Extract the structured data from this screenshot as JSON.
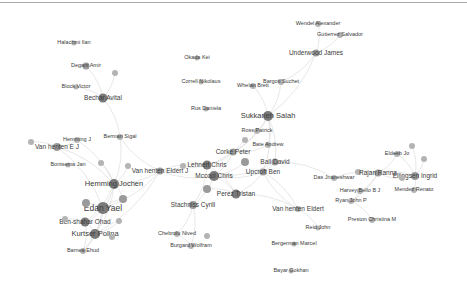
{
  "graph": {
    "type": "network",
    "node_color": "#8c8c8c",
    "edge_color": "#dcdcdc",
    "nodes": [
      {
        "id": "n1",
        "label": "Wendel Alexander",
        "x": 318,
        "y": 24,
        "r": 3,
        "size": "s1"
      },
      {
        "id": "n2",
        "label": "Gutierrez Salvador",
        "x": 340,
        "y": 35,
        "r": 3,
        "size": "s1"
      },
      {
        "id": "n3",
        "label": "Underwood James",
        "x": 316,
        "y": 53,
        "r": 3.5,
        "size": "s2"
      },
      {
        "id": "n4",
        "label": "Halachmi Ilan",
        "x": 74,
        "y": 43,
        "r": 2.5,
        "size": "s1"
      },
      {
        "id": "n5",
        "label": "Degani Amir",
        "x": 86,
        "y": 66,
        "r": 3.5,
        "size": "s1"
      },
      {
        "id": "n6",
        "label": "Block Victor",
        "x": 76,
        "y": 87,
        "r": 2.5,
        "size": "s1"
      },
      {
        "id": "n7",
        "label": "Bechar Avital",
        "x": 103,
        "y": 98,
        "r": 4.5,
        "size": "s2"
      },
      {
        "id": "n7b",
        "label": "",
        "x": 115,
        "y": 73,
        "r": 3,
        "size": "s1"
      },
      {
        "id": "n8",
        "label": "Okada Kei",
        "x": 197,
        "y": 58,
        "r": 2.5,
        "size": "s1"
      },
      {
        "id": "n9",
        "label": "Correll Nikolaus",
        "x": 201,
        "y": 82,
        "r": 2.5,
        "size": "s1"
      },
      {
        "id": "n10",
        "label": "Whelan Brett",
        "x": 253,
        "y": 86,
        "r": 3,
        "size": "s1"
      },
      {
        "id": "n11",
        "label": "Bargoti Suchet",
        "x": 281,
        "y": 82,
        "r": 3,
        "size": "s1"
      },
      {
        "id": "n12",
        "label": "Rus Daniela",
        "x": 206,
        "y": 109,
        "r": 2.5,
        "size": "s1"
      },
      {
        "id": "n13",
        "label": "Sukkarieh Salah",
        "x": 268,
        "y": 116,
        "r": 5,
        "size": "s3"
      },
      {
        "id": "n14",
        "label": "Ross Patrick",
        "x": 257,
        "y": 131,
        "r": 3,
        "size": "s1"
      },
      {
        "id": "n15",
        "label": "Bate Andrew",
        "x": 268,
        "y": 145,
        "r": 3,
        "size": "s1"
      },
      {
        "id": "n15b",
        "label": "",
        "x": 245,
        "y": 140,
        "r": 3,
        "size": "s1"
      },
      {
        "id": "n16",
        "label": "Corke Peter",
        "x": 233,
        "y": 152,
        "r": 3.5,
        "size": "s2"
      },
      {
        "id": "n16b",
        "label": "",
        "x": 245,
        "y": 162,
        "r": 4,
        "size": "s1"
      },
      {
        "id": "n17",
        "label": "Ball David",
        "x": 275,
        "y": 162,
        "r": 3.5,
        "size": "s2"
      },
      {
        "id": "n18",
        "label": "Upcroft Ben",
        "x": 263,
        "y": 172,
        "r": 3.5,
        "size": "s2"
      },
      {
        "id": "n19",
        "label": "Lehnert Chris",
        "x": 207,
        "y": 165,
        "r": 4.5,
        "size": "s2"
      },
      {
        "id": "n20",
        "label": "Mccool Chris",
        "x": 214,
        "y": 176,
        "r": 5,
        "size": "s2"
      },
      {
        "id": "n20b",
        "label": "",
        "x": 207,
        "y": 189,
        "r": 4,
        "size": "s1"
      },
      {
        "id": "n21",
        "label": "Perez Tristan",
        "x": 236,
        "y": 194,
        "r": 4.5,
        "size": "s2"
      },
      {
        "id": "n22",
        "label": "Stachniss Cyrill",
        "x": 193,
        "y": 205,
        "r": 4,
        "size": "s2"
      },
      {
        "id": "n23",
        "label": "Van henten Eldert J",
        "x": 160,
        "y": 171,
        "r": 3.5,
        "size": "s2"
      },
      {
        "id": "n23b",
        "label": "",
        "x": 183,
        "y": 166,
        "r": 3,
        "size": "s1"
      },
      {
        "id": "n24",
        "label": "Berman Sigal",
        "x": 120,
        "y": 137,
        "r": 3,
        "size": "s1"
      },
      {
        "id": "n25",
        "label": "Hemming J",
        "x": 77,
        "y": 140,
        "r": 3,
        "size": "s1"
      },
      {
        "id": "n26",
        "label": "Van henten E J",
        "x": 57,
        "y": 147,
        "r": 4,
        "size": "s2"
      },
      {
        "id": "n26b",
        "label": "",
        "x": 31,
        "y": 142,
        "r": 3,
        "size": "s1"
      },
      {
        "id": "n27",
        "label": "Bontsema Jan",
        "x": 68,
        "y": 165,
        "r": 2.5,
        "size": "s1"
      },
      {
        "id": "n27b",
        "label": "",
        "x": 101,
        "y": 163,
        "r": 3,
        "size": "s1"
      },
      {
        "id": "n27c",
        "label": "",
        "x": 128,
        "y": 166,
        "r": 3,
        "size": "s1"
      },
      {
        "id": "n28",
        "label": "Hemming Jochen",
        "x": 114,
        "y": 184,
        "r": 5,
        "size": "s3"
      },
      {
        "id": "n28b",
        "label": "",
        "x": 123,
        "y": 199,
        "r": 4,
        "size": "s1"
      },
      {
        "id": "n29",
        "label": "Edan Yael",
        "x": 103,
        "y": 208,
        "r": 6,
        "size": "s4"
      },
      {
        "id": "n29b",
        "label": "",
        "x": 86,
        "y": 203,
        "r": 4,
        "size": "s1"
      },
      {
        "id": "n30",
        "label": "Ben-shahar Ohad",
        "x": 85,
        "y": 222,
        "r": 4.5,
        "size": "s2"
      },
      {
        "id": "n30b",
        "label": "",
        "x": 65,
        "y": 219,
        "r": 3,
        "size": "s1"
      },
      {
        "id": "n30c",
        "label": "",
        "x": 119,
        "y": 221,
        "r": 3,
        "size": "s1"
      },
      {
        "id": "n31",
        "label": "Kurtser Polina",
        "x": 95,
        "y": 234,
        "r": 5,
        "size": "s3"
      },
      {
        "id": "n31b",
        "label": "",
        "x": 112,
        "y": 237,
        "r": 3,
        "size": "s1"
      },
      {
        "id": "n32",
        "label": "Barnea Ehud",
        "x": 83,
        "y": 251,
        "r": 3,
        "size": "s1"
      },
      {
        "id": "n33",
        "label": "Chebrolu Nived",
        "x": 177,
        "y": 234,
        "r": 3,
        "size": "s1"
      },
      {
        "id": "n33b",
        "label": "",
        "x": 207,
        "y": 236,
        "r": 3,
        "size": "s1"
      },
      {
        "id": "n34",
        "label": "Burgard Wolfram",
        "x": 191,
        "y": 246,
        "r": 3,
        "size": "s1"
      },
      {
        "id": "n35",
        "label": "Das Jnaneshwar",
        "x": 334,
        "y": 178,
        "r": 3,
        "size": "s1"
      },
      {
        "id": "n35b",
        "label": "",
        "x": 358,
        "y": 172,
        "r": 3,
        "size": "s1"
      },
      {
        "id": "n36",
        "label": "Van henten Eldert",
        "x": 298,
        "y": 209,
        "r": 3,
        "size": "s2"
      },
      {
        "id": "n37",
        "label": "Reid John",
        "x": 318,
        "y": 228,
        "r": 2.5,
        "size": "s1"
      },
      {
        "id": "n38",
        "label": "Bergerman Marcel",
        "x": 294,
        "y": 244,
        "r": 2.5,
        "size": "s1"
      },
      {
        "id": "n39",
        "label": "Bayar Gokhan",
        "x": 291,
        "y": 271,
        "r": 2.5,
        "size": "s1"
      },
      {
        "id": "n40",
        "label": "Eldeeb Jo",
        "x": 397,
        "y": 154,
        "r": 3,
        "size": "s1"
      },
      {
        "id": "n40b",
        "label": "",
        "x": 412,
        "y": 146,
        "r": 3,
        "size": "s1"
      },
      {
        "id": "n40c",
        "label": "",
        "x": 424,
        "y": 159,
        "r": 3,
        "size": "s1"
      },
      {
        "id": "n41",
        "label": "Rajan Ranna",
        "x": 378,
        "y": 173,
        "r": 3.5,
        "size": "s2"
      },
      {
        "id": "n42",
        "label": "Ellingsen Ingrid",
        "x": 415,
        "y": 176,
        "r": 4,
        "size": "s2"
      },
      {
        "id": "n42b",
        "label": "",
        "x": 402,
        "y": 178,
        "r": 3,
        "size": "s1"
      },
      {
        "id": "n43",
        "label": "Harvey Bello B J",
        "x": 360,
        "y": 191,
        "r": 3,
        "size": "s1"
      },
      {
        "id": "n44",
        "label": "Mendez Renato",
        "x": 414,
        "y": 190,
        "r": 3,
        "size": "s1"
      },
      {
        "id": "n45",
        "label": "Ryan John P",
        "x": 351,
        "y": 201,
        "r": 3,
        "size": "s1"
      },
      {
        "id": "n46",
        "label": "Preston Christina M",
        "x": 372,
        "y": 220,
        "r": 3,
        "size": "s1"
      }
    ],
    "edges": [
      [
        "n1",
        "n3"
      ],
      [
        "n2",
        "n3"
      ],
      [
        "n3",
        "n11"
      ],
      [
        "n3",
        "n13"
      ],
      [
        "n10",
        "n13"
      ],
      [
        "n11",
        "n13"
      ],
      [
        "n13",
        "n14"
      ],
      [
        "n13",
        "n15"
      ],
      [
        "n13",
        "n16"
      ],
      [
        "n13",
        "n18"
      ],
      [
        "n13",
        "n17"
      ],
      [
        "n14",
        "n16"
      ],
      [
        "n15",
        "n16"
      ],
      [
        "n15b",
        "n19"
      ],
      [
        "n16",
        "n19"
      ],
      [
        "n16",
        "n20"
      ],
      [
        "n16b",
        "n20"
      ],
      [
        "n17",
        "n18"
      ],
      [
        "n18",
        "n20"
      ],
      [
        "n17",
        "n20"
      ],
      [
        "n18",
        "n21"
      ],
      [
        "n19",
        "n20"
      ],
      [
        "n19",
        "n21"
      ],
      [
        "n20",
        "n21"
      ],
      [
        "n20",
        "n22"
      ],
      [
        "n20b",
        "n21"
      ],
      [
        "n19",
        "n22"
      ],
      [
        "n22",
        "n33"
      ],
      [
        "n22",
        "n34"
      ],
      [
        "n33",
        "n34"
      ],
      [
        "n19",
        "n23b"
      ],
      [
        "n23b",
        "n23"
      ],
      [
        "n23",
        "n28"
      ],
      [
        "n23",
        "n24"
      ],
      [
        "n23",
        "n19"
      ],
      [
        "n20",
        "n23"
      ],
      [
        "n5",
        "n7"
      ],
      [
        "n6",
        "n7"
      ],
      [
        "n7b",
        "n7"
      ],
      [
        "n7",
        "n24"
      ],
      [
        "n24",
        "n28"
      ],
      [
        "n25",
        "n28"
      ],
      [
        "n26",
        "n28"
      ],
      [
        "n26b",
        "n26"
      ],
      [
        "n25",
        "n26"
      ],
      [
        "n27b",
        "n28"
      ],
      [
        "n27c",
        "n28"
      ],
      [
        "n28",
        "n29"
      ],
      [
        "n28",
        "n28b"
      ],
      [
        "n28",
        "n31"
      ],
      [
        "n29",
        "n30"
      ],
      [
        "n29",
        "n31"
      ],
      [
        "n29b",
        "n29"
      ],
      [
        "n29",
        "n28b"
      ],
      [
        "n30",
        "n31"
      ],
      [
        "n30b",
        "n30"
      ],
      [
        "n30c",
        "n31"
      ],
      [
        "n31",
        "n31b"
      ],
      [
        "n31",
        "n32"
      ],
      [
        "n30",
        "n32"
      ],
      [
        "n29",
        "n32"
      ],
      [
        "n28",
        "n30"
      ],
      [
        "n26",
        "n29"
      ],
      [
        "n23",
        "n29"
      ],
      [
        "n23",
        "n31"
      ],
      [
        "n18",
        "n36"
      ],
      [
        "n17",
        "n35"
      ],
      [
        "n35",
        "n41"
      ],
      [
        "n35b",
        "n41"
      ],
      [
        "n41",
        "n43"
      ],
      [
        "n41",
        "n42"
      ],
      [
        "n40",
        "n41"
      ],
      [
        "n40",
        "n42"
      ],
      [
        "n40b",
        "n42"
      ],
      [
        "n40c",
        "n42"
      ],
      [
        "n42b",
        "n41"
      ],
      [
        "n42",
        "n44"
      ],
      [
        "n43",
        "n45"
      ],
      [
        "n45",
        "n46"
      ],
      [
        "n41",
        "n45"
      ],
      [
        "n36",
        "n37"
      ],
      [
        "n36",
        "n18"
      ],
      [
        "n21",
        "n36"
      ]
    ]
  }
}
